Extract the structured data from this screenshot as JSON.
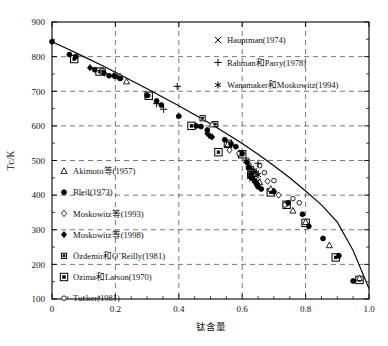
{
  "chart_data": {
    "type": "scatter",
    "title": "",
    "xlabel": "钛含量",
    "ylabel": "Tᴄ/K",
    "xlim": [
      0,
      1.0
    ],
    "ylim": [
      100,
      900
    ],
    "xticks": [
      "0",
      "0.2",
      "0.4",
      "0.6",
      "0.8",
      "1.0"
    ],
    "xtick_values": [
      0,
      0.2,
      0.4,
      0.6,
      0.8,
      1.0
    ],
    "yticks": [
      "100",
      "200",
      "300",
      "400",
      "500",
      "600",
      "700",
      "800",
      "900"
    ],
    "ytick_values": [
      100,
      200,
      300,
      400,
      500,
      600,
      700,
      800,
      900
    ],
    "grid": true,
    "grid_style": "dashed",
    "legend_position": "inside-left-lower and inside-right-upper",
    "trend_line": {
      "name": "fitted curve",
      "x": [
        0.0,
        0.05,
        0.1,
        0.15,
        0.2,
        0.25,
        0.3,
        0.35,
        0.4,
        0.45,
        0.5,
        0.55,
        0.6,
        0.65,
        0.7,
        0.75,
        0.8,
        0.85,
        0.9,
        0.95,
        1.0
      ],
      "y": [
        843,
        822,
        800,
        778,
        755,
        731,
        707,
        683,
        658,
        632,
        606,
        578,
        549,
        518,
        485,
        450,
        412,
        372,
        322,
        240,
        130
      ]
    },
    "series": [
      {
        "name": "Akimoto等(1957)",
        "label": "Akimoto等(1957)",
        "marker": "triangle-open",
        "points": [
          {
            "x": 0.215,
            "y": 742
          },
          {
            "x": 0.235,
            "y": 728
          },
          {
            "x": 0.505,
            "y": 604
          },
          {
            "x": 0.555,
            "y": 547
          },
          {
            "x": 0.595,
            "y": 520
          },
          {
            "x": 0.635,
            "y": 470
          },
          {
            "x": 0.655,
            "y": 437
          },
          {
            "x": 0.69,
            "y": 418
          },
          {
            "x": 0.76,
            "y": 355
          },
          {
            "x": 0.8,
            "y": 322
          },
          {
            "x": 0.875,
            "y": 255
          },
          {
            "x": 0.97,
            "y": 160
          }
        ]
      },
      {
        "name": "Bleil(1973)",
        "label": "Bleil(1973)",
        "marker": "circle-filled",
        "points": [
          {
            "x": 0.0,
            "y": 843
          },
          {
            "x": 0.055,
            "y": 806
          },
          {
            "x": 0.075,
            "y": 800
          },
          {
            "x": 0.135,
            "y": 762
          },
          {
            "x": 0.18,
            "y": 745
          },
          {
            "x": 0.2,
            "y": 743
          },
          {
            "x": 0.215,
            "y": 737
          },
          {
            "x": 0.3,
            "y": 688
          },
          {
            "x": 0.33,
            "y": 672
          },
          {
            "x": 0.345,
            "y": 660
          },
          {
            "x": 0.4,
            "y": 628
          },
          {
            "x": 0.455,
            "y": 600
          },
          {
            "x": 0.47,
            "y": 598
          },
          {
            "x": 0.49,
            "y": 588
          },
          {
            "x": 0.5,
            "y": 570
          },
          {
            "x": 0.545,
            "y": 560
          },
          {
            "x": 0.565,
            "y": 548
          },
          {
            "x": 0.58,
            "y": 540
          },
          {
            "x": 0.6,
            "y": 520
          },
          {
            "x": 0.615,
            "y": 495
          },
          {
            "x": 0.62,
            "y": 478
          },
          {
            "x": 0.628,
            "y": 462
          },
          {
            "x": 0.632,
            "y": 450
          },
          {
            "x": 0.64,
            "y": 440
          },
          {
            "x": 0.645,
            "y": 432
          },
          {
            "x": 0.65,
            "y": 424
          },
          {
            "x": 0.66,
            "y": 418
          },
          {
            "x": 0.7,
            "y": 410
          },
          {
            "x": 0.745,
            "y": 378
          },
          {
            "x": 0.79,
            "y": 345
          },
          {
            "x": 0.81,
            "y": 310
          },
          {
            "x": 0.855,
            "y": 275
          },
          {
            "x": 0.905,
            "y": 225
          },
          {
            "x": 0.95,
            "y": 152
          }
        ]
      },
      {
        "name": "Moskowitz等(1993)",
        "label": "Moskowitz等(1993)",
        "marker": "diamond-open",
        "points": [
          {
            "x": 0.56,
            "y": 530
          },
          {
            "x": 0.618,
            "y": 500
          },
          {
            "x": 0.645,
            "y": 462
          },
          {
            "x": 0.68,
            "y": 440
          },
          {
            "x": 0.715,
            "y": 400
          },
          {
            "x": 0.735,
            "y": 372
          }
        ]
      },
      {
        "name": "Moskowitz等(1998)",
        "label": "Moskowitz等(1998)",
        "marker": "diamond-filled",
        "points": [
          {
            "x": 0.12,
            "y": 768
          },
          {
            "x": 0.165,
            "y": 752
          },
          {
            "x": 0.195,
            "y": 745
          },
          {
            "x": 0.49,
            "y": 578
          },
          {
            "x": 0.505,
            "y": 568
          },
          {
            "x": 0.625,
            "y": 452
          },
          {
            "x": 0.637,
            "y": 444
          }
        ]
      },
      {
        "name": "Özdemir和O’Reilly(1981)",
        "label": "Özdemir和O’Reilly(1981)",
        "marker": "square-dot-small",
        "points": [
          {
            "x": 0.16,
            "y": 757
          },
          {
            "x": 0.475,
            "y": 622
          },
          {
            "x": 0.515,
            "y": 605
          },
          {
            "x": 0.625,
            "y": 460
          }
        ]
      },
      {
        "name": "Ozima和Larson(1970)",
        "label": "Ozima和Larson(1970)",
        "marker": "square-dot-large",
        "points": [
          {
            "x": 0.07,
            "y": 793
          },
          {
            "x": 0.15,
            "y": 757
          },
          {
            "x": 0.305,
            "y": 687
          },
          {
            "x": 0.44,
            "y": 600
          },
          {
            "x": 0.525,
            "y": 524
          },
          {
            "x": 0.555,
            "y": 548
          },
          {
            "x": 0.6,
            "y": 518
          },
          {
            "x": 0.69,
            "y": 408
          },
          {
            "x": 0.74,
            "y": 372
          },
          {
            "x": 0.8,
            "y": 320
          },
          {
            "x": 0.895,
            "y": 220
          },
          {
            "x": 0.97,
            "y": 155
          }
        ]
      },
      {
        "name": "Tucker(1981)",
        "label": "Tucker(1981)",
        "marker": "circle-open-small",
        "points": [
          {
            "x": 0.59,
            "y": 520
          },
          {
            "x": 0.655,
            "y": 485
          },
          {
            "x": 0.67,
            "y": 465
          },
          {
            "x": 0.7,
            "y": 442
          },
          {
            "x": 0.76,
            "y": 390
          },
          {
            "x": 0.78,
            "y": 378
          }
        ]
      },
      {
        "name": "Hauptman(1974)",
        "label": "Hauptman(1974)",
        "marker": "cross-x",
        "points": [
          {
            "x": 0.625,
            "y": 455
          },
          {
            "x": 0.632,
            "y": 448
          },
          {
            "x": 0.64,
            "y": 444
          },
          {
            "x": 0.648,
            "y": 440
          }
        ]
      },
      {
        "name": "Rahman和Parry(1978)",
        "label": "Rahman和Parry(1978)",
        "marker": "plus",
        "points": [
          {
            "x": 0.395,
            "y": 714
          },
          {
            "x": 0.33,
            "y": 664
          },
          {
            "x": 0.352,
            "y": 648
          },
          {
            "x": 0.65,
            "y": 492
          }
        ]
      },
      {
        "name": "Wanamaker和Moskowitz(1994)",
        "label": "Wanamaker和Moskowitz(1994)",
        "marker": "asterisk",
        "points": [
          {
            "x": 0.612,
            "y": 498
          },
          {
            "x": 0.62,
            "y": 488
          },
          {
            "x": 0.628,
            "y": 480
          },
          {
            "x": 0.636,
            "y": 472
          },
          {
            "x": 0.644,
            "y": 466
          },
          {
            "x": 0.65,
            "y": 458
          }
        ]
      }
    ]
  },
  "legend_left": {
    "items": [
      {
        "marker": "triangle-open",
        "label": "Akimoto等(1957)"
      },
      {
        "marker": "circle-filled",
        "label": "Bleil(1973)"
      },
      {
        "marker": "diamond-open",
        "label": "Moskowitz等(1993)"
      },
      {
        "marker": "diamond-filled",
        "label": "Moskowitz等(1998)"
      },
      {
        "marker": "square-dot-small",
        "label": "Özdemir和O’Reilly(1981)"
      },
      {
        "marker": "square-dot-large",
        "label": "Ozima和Larson(1970)"
      },
      {
        "marker": "circle-open-small",
        "label": "Tucker(1981)"
      }
    ]
  },
  "legend_right": {
    "items": [
      {
        "marker": "cross-x",
        "label": "Hauptman(1974)"
      },
      {
        "marker": "plus",
        "label": "Rahman和Parry(1978)"
      },
      {
        "marker": "asterisk",
        "label": "Wanamaker和Moskowitz(1994)"
      }
    ]
  },
  "colors": {
    "ink": "#000000",
    "background": "#ffffff",
    "grid": "#555555"
  }
}
